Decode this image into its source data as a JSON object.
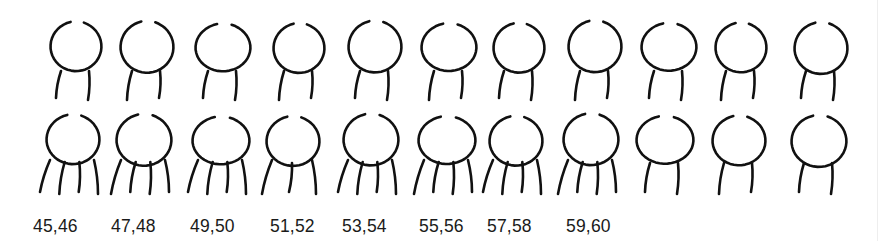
{
  "figure": {
    "rows": [
      {
        "name": "top-row",
        "figures": [
          {
            "legs": 2
          },
          {
            "legs": 2
          },
          {
            "legs": 2
          },
          {
            "legs": 2
          },
          {
            "legs": 2
          },
          {
            "legs": 2
          },
          {
            "legs": 2
          },
          {
            "legs": 2
          },
          {
            "legs": 2
          },
          {
            "legs": 2
          },
          {
            "legs": 2
          }
        ]
      },
      {
        "name": "bottom-row",
        "figures": [
          {
            "legs": 4
          },
          {
            "legs": 4
          },
          {
            "legs": 4
          },
          {
            "legs": 3
          },
          {
            "legs": 4
          },
          {
            "legs": 4
          },
          {
            "legs": 4
          },
          {
            "legs": 4
          },
          {
            "legs": 2
          },
          {
            "legs": 2
          },
          {
            "legs": 2
          }
        ]
      }
    ],
    "labels": [
      "45,46",
      "47,48",
      "49,50",
      "51,52",
      "53,54",
      "55,56",
      "57,58",
      "59,60"
    ],
    "stroke_color": "#111111",
    "background_color": "#ffffff"
  }
}
